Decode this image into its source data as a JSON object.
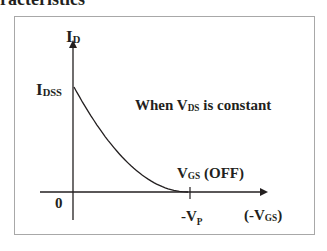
{
  "heading": "racteristics",
  "diagram": {
    "y_axis_label": {
      "main": "I",
      "sub": "D"
    },
    "x_axis_label": {
      "prefix": "(-V",
      "sub": "GS",
      "suffix": ")"
    },
    "origin_label": "0",
    "idss_label": {
      "main": "I",
      "sub": "DSS"
    },
    "condition_label": {
      "prefix": "When V",
      "sub": "DS",
      "suffix": " is constant"
    },
    "vgs_off_label": {
      "prefix": "V",
      "sub": "GS",
      "suffix": " (OFF)"
    },
    "vp_label": {
      "prefix": "-V",
      "sub": "P"
    },
    "colors": {
      "line": "#231f20",
      "frame": "#a8a8a8",
      "text": "#231f20"
    }
  },
  "chart_data": {
    "type": "line",
    "xlabel": "(-VGS)",
    "ylabel": "ID",
    "series": [
      {
        "name": "ID vs -VGS",
        "x": [
          0,
          0.25,
          0.5,
          0.75,
          1.0
        ],
        "y": [
          1.0,
          0.5625,
          0.25,
          0.0625,
          0.0
        ]
      }
    ],
    "x_ticks": [
      "0",
      "-VP"
    ],
    "y_ticks": [
      "IDSS"
    ],
    "annotation": "When VDS is constant"
  }
}
